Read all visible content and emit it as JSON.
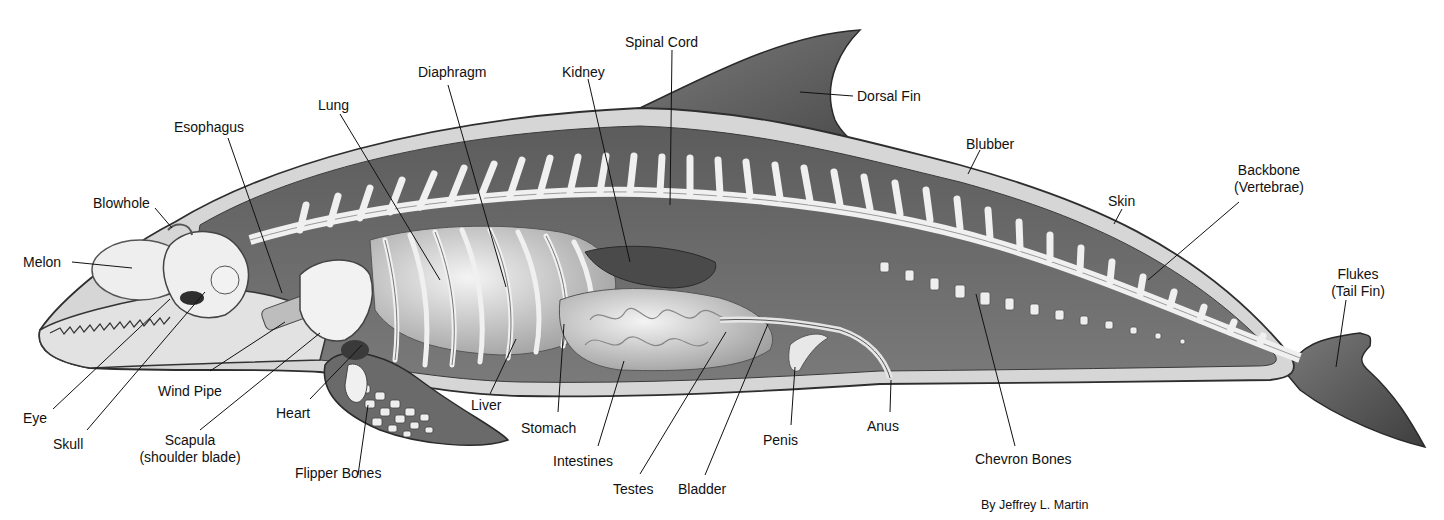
{
  "diagram": {
    "credit": "By Jeffrey L. Martin",
    "labels": {
      "spinal_cord": "Spinal Cord",
      "dorsal_fin": "Dorsal Fin",
      "kidney": "Kidney",
      "diaphragm": "Diaphragm",
      "lung": "Lung",
      "esophagus": "Esophagus",
      "blubber": "Blubber",
      "backbone_1": "Backbone",
      "backbone_2": "(Vertebrae)",
      "skin": "Skin",
      "blowhole": "Blowhole",
      "melon": "Melon",
      "flukes_1": "Flukes",
      "flukes_2": "(Tail Fin)",
      "eye": "Eye",
      "wind_pipe": "Wind Pipe",
      "heart": "Heart",
      "liver": "Liver",
      "skull": "Skull",
      "scapula_1": "Scapula",
      "scapula_2": "(shoulder blade)",
      "stomach": "Stomach",
      "penis": "Penis",
      "anus": "Anus",
      "intestines": "Intestines",
      "chevron_bones": "Chevron Bones",
      "flipper_bones": "Flipper Bones",
      "testes": "Testes",
      "bladder": "Bladder"
    },
    "colors": {
      "skin_outline": "#3a3a3a",
      "blubber": "#d6d6d6",
      "body_cavity": "#6e6e6e",
      "bone": "#ececec",
      "fin": "#5a5a5a",
      "label_text": "#111111",
      "leader_line": "#111111",
      "background": "#ffffff"
    }
  }
}
